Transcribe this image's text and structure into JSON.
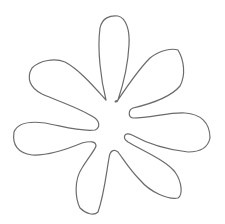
{
  "image": {
    "subject": "flower outline drawing",
    "petal_count": 7,
    "stroke_color": "#6b6b6b",
    "background_color": "#ffffff"
  }
}
